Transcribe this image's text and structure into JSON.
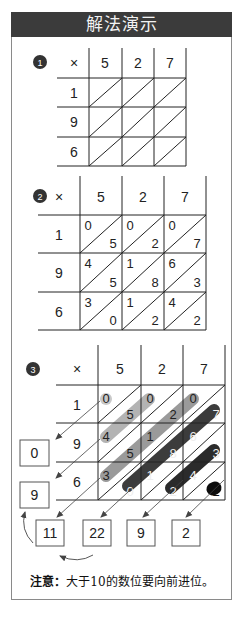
{
  "header": {
    "title": "解法演示"
  },
  "steps": [
    {
      "badge": "1",
      "corner": "×",
      "top_digits": [
        "5",
        "2",
        "7"
      ],
      "left_digits": [
        "1",
        "9",
        "6"
      ]
    },
    {
      "badge": "2",
      "corner": "×",
      "top_digits": [
        "5",
        "2",
        "7"
      ],
      "left_digits": [
        "1",
        "9",
        "6"
      ],
      "cells": [
        [
          [
            "0",
            "5"
          ],
          [
            "0",
            "2"
          ],
          [
            "0",
            "7"
          ]
        ],
        [
          [
            "4",
            "5"
          ],
          [
            "1",
            "8"
          ],
          [
            "6",
            "3"
          ]
        ],
        [
          [
            "3",
            "0"
          ],
          [
            "1",
            "2"
          ],
          [
            "4",
            "2"
          ]
        ]
      ]
    },
    {
      "badge": "3",
      "corner": "×",
      "top_digits": [
        "5",
        "2",
        "7"
      ],
      "left_digits": [
        "1",
        "9",
        "6"
      ],
      "cells": [
        [
          [
            "0",
            "5"
          ],
          [
            "0",
            "2"
          ],
          [
            "0",
            "7"
          ]
        ],
        [
          [
            "4",
            "5"
          ],
          [
            "1",
            "8"
          ],
          [
            "6",
            "3"
          ]
        ],
        [
          [
            "3",
            "0"
          ],
          [
            "1",
            "2"
          ],
          [
            "4",
            "2"
          ]
        ]
      ],
      "left_results": [
        "0",
        "9"
      ],
      "bottom_results": [
        "11",
        "22",
        "9",
        "2"
      ]
    }
  ],
  "note": {
    "label": "注意：",
    "text": "大于10的数位要向前进位。"
  },
  "colors": {
    "header_bg": "#3b3b3b",
    "diag_light": "#bdbdbd",
    "diag_mid": "#9a9a9a",
    "diag_dark": "#3a3a3a",
    "diag_black": "#111111"
  }
}
